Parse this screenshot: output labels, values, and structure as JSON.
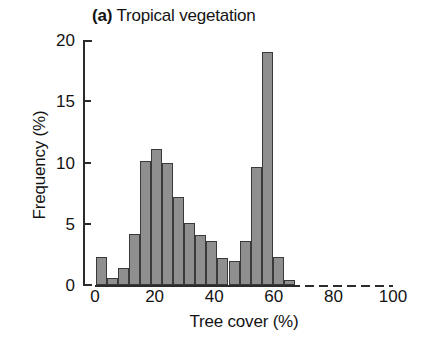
{
  "figure": {
    "panel_letter": "(a)",
    "panel_title": "Tropical vegetation",
    "background_color": "#ffffff",
    "bar_fill_color": "#8f8f8f",
    "bar_edge_color": "#3a3a3a",
    "axis_color": "#2b2b2b"
  },
  "chart_data": {
    "type": "bar",
    "title": "(a) Tropical vegetation",
    "xlabel": "Tree cover (%)",
    "ylabel": "Frequency (%)",
    "xlim": [
      0,
      100
    ],
    "ylim": [
      0,
      20
    ],
    "xticks": [
      0,
      20,
      40,
      60,
      80,
      100
    ],
    "xticklabels": [
      "0",
      "20",
      "40",
      "60",
      "80",
      "100"
    ],
    "yticks": [
      0,
      5,
      10,
      15,
      20
    ],
    "yticklabels": [
      "0",
      "5",
      "10",
      "15",
      "20"
    ],
    "grid": false,
    "legend": null,
    "bin_width": 3.7,
    "bin_starts": [
      0.4,
      4.1,
      7.8,
      11.5,
      15.2,
      18.9,
      22.6,
      26.3,
      30.0,
      33.7,
      37.4,
      41.1,
      44.8,
      48.5,
      52.2,
      55.9,
      59.6,
      63.3
    ],
    "categories": [
      "0-4",
      "4-8",
      "8-11",
      "11-15",
      "15-19",
      "19-23",
      "23-26",
      "26-30",
      "30-34",
      "34-37",
      "37-41",
      "41-45",
      "45-48",
      "48-52",
      "52-56",
      "56-60",
      "60-63",
      "63-67"
    ],
    "values": [
      2.3,
      0.6,
      1.4,
      4.2,
      10.1,
      11.1,
      10.0,
      7.2,
      5.1,
      4.1,
      3.6,
      2.2,
      2.0,
      3.6,
      9.6,
      19.0,
      2.3,
      0.4
    ]
  },
  "bars_px": {
    "x0_percent": [
      0.4,
      4.1,
      7.8,
      11.5,
      15.2,
      18.9,
      22.6,
      26.3,
      30.0,
      33.7,
      37.4,
      41.1,
      44.8,
      48.5,
      52.2,
      55.9,
      59.6,
      63.3
    ]
  }
}
